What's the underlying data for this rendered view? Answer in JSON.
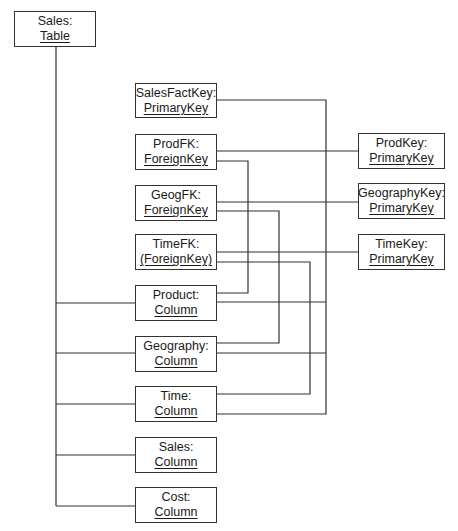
{
  "diagram": {
    "stroke_color": "#333333",
    "nodes": [
      {
        "id": "sales_table",
        "name": "Sales:",
        "type": "Table",
        "x": 14,
        "y": 11,
        "w": 82,
        "h": 36
      },
      {
        "id": "salesfactkey",
        "name": "SalesFactKey:",
        "type": "PrimaryKey",
        "x": 135,
        "y": 83,
        "w": 82,
        "h": 35
      },
      {
        "id": "prodfk",
        "name": "ProdFK:",
        "type": "ForeignKey",
        "x": 135,
        "y": 134,
        "w": 82,
        "h": 36
      },
      {
        "id": "geogfk",
        "name": "GeogFK:",
        "type": "ForeignKey",
        "x": 135,
        "y": 185,
        "w": 82,
        "h": 36
      },
      {
        "id": "timefk",
        "name": "TimeFK:",
        "type": "(ForeignKey)",
        "x": 135,
        "y": 234,
        "w": 82,
        "h": 36
      },
      {
        "id": "product_col",
        "name": "Product:",
        "type": "Column",
        "x": 135,
        "y": 285,
        "w": 82,
        "h": 36
      },
      {
        "id": "geography_col",
        "name": "Geography:",
        "type": "Column",
        "x": 135,
        "y": 336,
        "w": 82,
        "h": 36
      },
      {
        "id": "time_col",
        "name": "Time:",
        "type": "Column",
        "x": 135,
        "y": 386,
        "w": 82,
        "h": 36
      },
      {
        "id": "sales_col",
        "name": "Sales:",
        "type": "Column",
        "x": 135,
        "y": 437,
        "w": 82,
        "h": 36
      },
      {
        "id": "cost_col",
        "name": "Cost:",
        "type": "Column",
        "x": 135,
        "y": 487,
        "w": 82,
        "h": 36
      },
      {
        "id": "prodkey",
        "name": "ProdKey:",
        "type": "PrimaryKey",
        "x": 358,
        "y": 133,
        "w": 87,
        "h": 36
      },
      {
        "id": "geographykey",
        "name": "GeographyKey:",
        "type": "PrimaryKey",
        "x": 358,
        "y": 183,
        "w": 87,
        "h": 36
      },
      {
        "id": "timekey",
        "name": "TimeKey:",
        "type": "PrimaryKey",
        "x": 358,
        "y": 234,
        "w": 87,
        "h": 36
      }
    ],
    "connectors": [
      {
        "id": "table-trunk",
        "points": [
          [
            56,
            47
          ],
          [
            56,
            506
          ]
        ]
      },
      {
        "id": "table-to-product",
        "points": [
          [
            56,
            303
          ],
          [
            135,
            303
          ]
        ]
      },
      {
        "id": "table-to-geography",
        "points": [
          [
            56,
            353
          ],
          [
            135,
            353
          ]
        ]
      },
      {
        "id": "table-to-time",
        "points": [
          [
            56,
            404
          ],
          [
            135,
            404
          ]
        ]
      },
      {
        "id": "table-to-sales",
        "points": [
          [
            56,
            455
          ],
          [
            135,
            455
          ]
        ]
      },
      {
        "id": "table-to-cost",
        "points": [
          [
            56,
            506
          ],
          [
            135,
            506
          ]
        ]
      },
      {
        "id": "salesfactkey-bus",
        "points": [
          [
            217,
            100
          ],
          [
            326,
            100
          ],
          [
            326,
            414
          ],
          [
            217,
            414
          ]
        ]
      },
      {
        "id": "prodfk-to-prodkey",
        "points": [
          [
            217,
            151
          ],
          [
            358,
            151
          ]
        ]
      },
      {
        "id": "geogfk-to-geographykey",
        "points": [
          [
            217,
            202
          ],
          [
            358,
            202
          ]
        ]
      },
      {
        "id": "timefk-to-timekey",
        "points": [
          [
            217,
            252
          ],
          [
            358,
            252
          ]
        ]
      },
      {
        "id": "prodfk-to-product",
        "points": [
          [
            217,
            161
          ],
          [
            248,
            161
          ],
          [
            248,
            293
          ],
          [
            217,
            293
          ]
        ]
      },
      {
        "id": "geogfk-to-geography",
        "points": [
          [
            217,
            211
          ],
          [
            279,
            211
          ],
          [
            279,
            343
          ],
          [
            217,
            343
          ]
        ]
      },
      {
        "id": "timefk-to-time",
        "points": [
          [
            217,
            262
          ],
          [
            310,
            262
          ],
          [
            310,
            394
          ],
          [
            217,
            394
          ]
        ]
      },
      {
        "id": "product-to-bus",
        "points": [
          [
            217,
            302
          ],
          [
            326,
            302
          ]
        ]
      },
      {
        "id": "geography-to-bus",
        "points": [
          [
            217,
            353
          ],
          [
            326,
            353
          ]
        ]
      }
    ]
  }
}
